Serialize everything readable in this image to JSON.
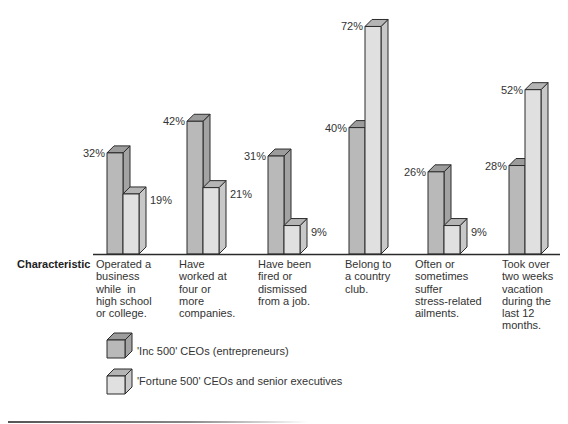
{
  "chart_data": {
    "type": "bar",
    "style": "3d-grouped-bar",
    "title": "",
    "xlabel": "Characteristic",
    "ylabel": "",
    "ylim": [
      0,
      80
    ],
    "grid": false,
    "legend_position": "bottom-left",
    "categories": [
      "Operated a business while in high school or college.",
      "Have worked at four or more companies.",
      "Have been fired or dismissed from a job.",
      "Belong to a country club.",
      "Often or sometimes suffer stress-related ailments.",
      "Took over two weeks vacation during the last 12 months."
    ],
    "series": [
      {
        "name": "'Inc 500' CEOs (entrepreneurs)",
        "values": [
          32,
          42,
          31,
          40,
          26,
          28
        ],
        "color": "#b9b9b9"
      },
      {
        "name": "'Fortune 500' CEOs and senior executives",
        "values": [
          19,
          21,
          9,
          72,
          9,
          52
        ],
        "color": "#e0e0e0"
      }
    ],
    "value_labels": [
      [
        "32%",
        "42%",
        "31%",
        "40%",
        "26%",
        "28%"
      ],
      [
        "19%",
        "21%",
        "9%",
        "72%",
        "9%",
        "52%"
      ]
    ]
  },
  "axis": {
    "characteristic_label": "Characteristic"
  },
  "categories_display": [
    "Operated a\nbusiness\nwhile  in\nhigh school\nor college.",
    "Have\nworked at\nfour or\nmore\ncompanies.",
    "Have been\nfired or\ndismissed\nfrom a job.",
    "Belong to\na country\nclub.",
    "Often or\nsometimes\nsuffer\nstress-related\nailments.",
    "Took over\ntwo weeks\nvacation\nduring the\nlast 12\nmonths."
  ],
  "legend": {
    "items": [
      {
        "label": "'Inc 500' CEOs (entrepreneurs)"
      },
      {
        "label": "'Fortune 500' CEOs and senior executives"
      }
    ]
  },
  "colors": {
    "dark_front": "#b9b9b9",
    "dark_side": "#a3a3a3",
    "dark_top": "#9c9c9c",
    "light_front": "#e0e0e0",
    "light_side": "#c8c8c8",
    "light_top": "#b4b4b4",
    "stroke": "#2b2b2b"
  }
}
